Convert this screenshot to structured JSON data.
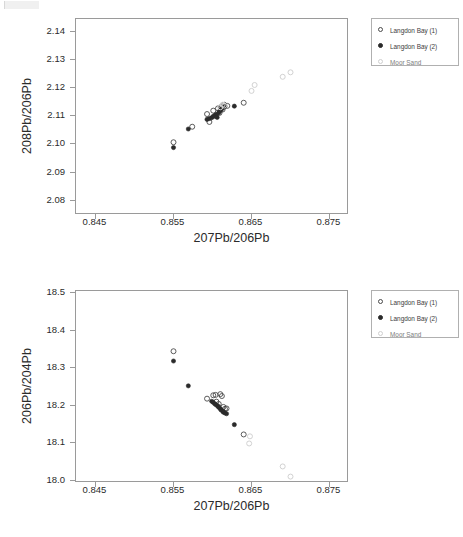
{
  "chart_data": [
    {
      "id": "top",
      "type": "scatter",
      "title": "",
      "xlabel": "207Pb/206Pb",
      "ylabel": "208Pb/206Pb",
      "xlim": [
        0.8425,
        0.8775
      ],
      "ylim": [
        2.075,
        2.1445
      ],
      "xticks": [
        0.845,
        0.855,
        0.865,
        0.875
      ],
      "xtick_labels": [
        "0.845",
        "0.855",
        "0.865",
        "0.875"
      ],
      "yticks": [
        2.08,
        2.09,
        2.1,
        2.11,
        2.12,
        2.13,
        2.14
      ],
      "ytick_labels": [
        "2.08",
        "2.09",
        "2.10",
        "2.11",
        "2.12",
        "2.13",
        "2.14"
      ],
      "grid": false,
      "legend_position": "outside-top-right",
      "series": [
        {
          "name": "Langdon Bay (1)",
          "marker": "open-circle",
          "color": "#4a4a4a",
          "points": [
            [
              0.855,
              2.1008
            ],
            [
              0.8574,
              2.1063
            ],
            [
              0.8593,
              2.1108
            ],
            [
              0.8596,
              2.108
            ],
            [
              0.8601,
              2.112
            ],
            [
              0.8604,
              2.1101
            ],
            [
              0.8607,
              2.1128
            ],
            [
              0.8609,
              2.1112
            ],
            [
              0.8611,
              2.1133
            ],
            [
              0.8613,
              2.1124
            ],
            [
              0.8615,
              2.1141
            ],
            [
              0.8619,
              2.1137
            ],
            [
              0.864,
              2.1148
            ]
          ]
        },
        {
          "name": "Langdon Bay (2)",
          "marker": "filled-circle",
          "color": "#2a2a2a",
          "points": [
            [
              0.855,
              2.0989
            ],
            [
              0.8569,
              2.1055
            ],
            [
              0.8593,
              2.1089
            ],
            [
              0.8596,
              2.1092
            ],
            [
              0.8599,
              2.1095
            ],
            [
              0.8601,
              2.11
            ],
            [
              0.8603,
              2.1103
            ],
            [
              0.8605,
              2.1107
            ],
            [
              0.8606,
              2.1096
            ],
            [
              0.8608,
              2.1112
            ],
            [
              0.8609,
              2.1118
            ],
            [
              0.8611,
              2.1122
            ],
            [
              0.8612,
              2.1128
            ],
            [
              0.8614,
              2.1131
            ],
            [
              0.8616,
              2.1135
            ],
            [
              0.8628,
              2.1136
            ]
          ]
        },
        {
          "name": "Moor Sand",
          "marker": "light-circle",
          "color": "#d2d2d2",
          "points": [
            [
              0.861,
              2.1132
            ],
            [
              0.8613,
              2.1141
            ],
            [
              0.8615,
              2.1138
            ],
            [
              0.865,
              2.119
            ],
            [
              0.8654,
              2.1211
            ],
            [
              0.869,
              2.124
            ],
            [
              0.87,
              2.1256
            ]
          ]
        }
      ]
    },
    {
      "id": "bottom",
      "type": "scatter",
      "title": "",
      "xlabel": "207Pb/206Pb",
      "ylabel": "206Pb/204Pb",
      "xlim": [
        0.8425,
        0.8775
      ],
      "ylim": [
        17.995,
        18.505
      ],
      "xticks": [
        0.845,
        0.855,
        0.865,
        0.875
      ],
      "xtick_labels": [
        "0.845",
        "0.855",
        "0.865",
        "0.875"
      ],
      "yticks": [
        18.0,
        18.1,
        18.2,
        18.3,
        18.4,
        18.5
      ],
      "ytick_labels": [
        "18.0",
        "18.1",
        "18.2",
        "18.3",
        "18.4",
        "18.5"
      ],
      "grid": false,
      "legend_position": "outside-top-right",
      "series": [
        {
          "name": "Langdon Bay (1)",
          "marker": "open-circle",
          "color": "#4a4a4a",
          "points": [
            [
              0.855,
              18.345
            ],
            [
              0.8593,
              18.219
            ],
            [
              0.8601,
              18.228
            ],
            [
              0.8604,
              18.229
            ],
            [
              0.8605,
              18.211
            ],
            [
              0.8608,
              18.205
            ],
            [
              0.861,
              18.231
            ],
            [
              0.8612,
              18.226
            ],
            [
              0.8614,
              18.197
            ],
            [
              0.8616,
              18.192
            ],
            [
              0.8618,
              18.193
            ],
            [
              0.864,
              18.124
            ]
          ]
        },
        {
          "name": "Langdon Bay (2)",
          "marker": "filled-circle",
          "color": "#2a2a2a",
          "points": [
            [
              0.855,
              18.319
            ],
            [
              0.8569,
              18.253
            ],
            [
              0.8599,
              18.212
            ],
            [
              0.8601,
              18.209
            ],
            [
              0.8603,
              18.205
            ],
            [
              0.8605,
              18.202
            ],
            [
              0.8607,
              18.199
            ],
            [
              0.8608,
              18.196
            ],
            [
              0.861,
              18.192
            ],
            [
              0.8611,
              18.189
            ],
            [
              0.8613,
              18.186
            ],
            [
              0.8614,
              18.183
            ],
            [
              0.8616,
              18.181
            ],
            [
              0.8618,
              18.179
            ],
            [
              0.8628,
              18.15
            ]
          ]
        },
        {
          "name": "Moor Sand",
          "marker": "light-circle",
          "color": "#d2d2d2",
          "points": [
            [
              0.8648,
              18.119
            ],
            [
              0.8647,
              18.1
            ],
            [
              0.869,
              18.039
            ],
            [
              0.87,
              18.012
            ]
          ]
        }
      ]
    }
  ],
  "figures": {
    "top": {
      "legend": {
        "entries": [
          {
            "label": "Langdon Bay (1)",
            "marker": "open-circle"
          },
          {
            "label": "Langdon Bay (2)",
            "marker": "filled-circle"
          },
          {
            "label": "Moor Sand",
            "marker": "light-circle"
          }
        ]
      }
    },
    "bottom": {
      "legend": {
        "entries": [
          {
            "label": "Langdon Bay (1)",
            "marker": "open-circle"
          },
          {
            "label": "Langdon Bay (2)",
            "marker": "filled-circle"
          },
          {
            "label": "Moor Sand",
            "marker": "light-circle"
          }
        ]
      }
    }
  },
  "colors": {
    "series_1": "#4a4a4a",
    "series_2": "#2a2a2a",
    "series_3": "#d2d2d2",
    "axis": "#9a9a9a",
    "text": "#2b2b2b"
  }
}
